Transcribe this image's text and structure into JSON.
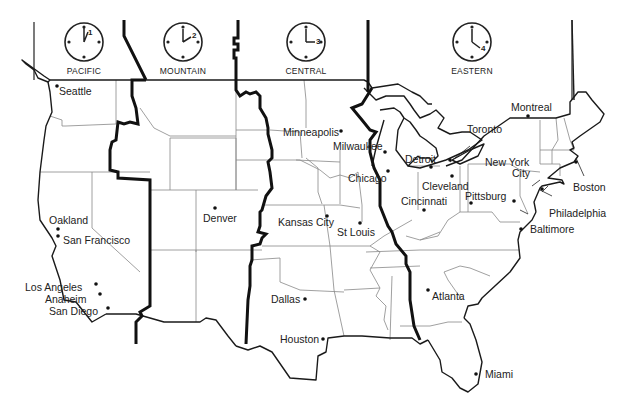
{
  "map": {
    "title": "US Time Zones",
    "time_zones": [
      {
        "id": "pacific",
        "label": "PACIFIC",
        "clock_hour": "1"
      },
      {
        "id": "mountain",
        "label": "MOUNTAIN",
        "clock_hour": "2"
      },
      {
        "id": "central",
        "label": "CENTRAL",
        "clock_hour": "3"
      },
      {
        "id": "eastern",
        "label": "EASTERN",
        "clock_hour": "4"
      }
    ],
    "cities": [
      {
        "name": "Seattle",
        "zone": "Pacific"
      },
      {
        "name": "Oakland",
        "zone": "Pacific"
      },
      {
        "name": "San Francisco",
        "zone": "Pacific"
      },
      {
        "name": "Los Angeles",
        "zone": "Pacific"
      },
      {
        "name": "Anaheim",
        "zone": "Pacific"
      },
      {
        "name": "San Diego",
        "zone": "Pacific"
      },
      {
        "name": "Denver",
        "zone": "Mountain"
      },
      {
        "name": "Minneapolis",
        "zone": "Central"
      },
      {
        "name": "Milwaukee",
        "zone": "Central"
      },
      {
        "name": "Chicago",
        "zone": "Central"
      },
      {
        "name": "Kansas City",
        "zone": "Central"
      },
      {
        "name": "St Louis",
        "zone": "Central"
      },
      {
        "name": "Dallas",
        "zone": "Central"
      },
      {
        "name": "Houston",
        "zone": "Central"
      },
      {
        "name": "Detroit",
        "zone": "Eastern"
      },
      {
        "name": "Toronto",
        "zone": "Eastern"
      },
      {
        "name": "Montreal",
        "zone": "Eastern"
      },
      {
        "name": "Cleveland",
        "zone": "Eastern"
      },
      {
        "name": "Cincinnati",
        "zone": "Eastern"
      },
      {
        "name": "Pittsburg",
        "zone": "Eastern"
      },
      {
        "name": "New York City",
        "zone": "Eastern"
      },
      {
        "name": "Boston",
        "zone": "Eastern"
      },
      {
        "name": "Philadelphia",
        "zone": "Eastern"
      },
      {
        "name": "Baltimore",
        "zone": "Eastern"
      },
      {
        "name": "Atlanta",
        "zone": "Eastern"
      },
      {
        "name": "Miami",
        "zone": "Eastern"
      }
    ],
    "labels": {
      "new_york_line1": "New York",
      "new_york_line2": "City"
    }
  }
}
